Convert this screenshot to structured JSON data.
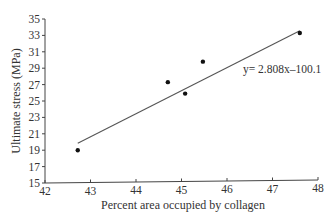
{
  "chart_data": {
    "type": "scatter",
    "title": "",
    "xlabel": "Percent area occupied by collagen",
    "ylabel": "Ultimate stress (MPa)",
    "xlim": [
      42,
      48
    ],
    "ylim": [
      15,
      35
    ],
    "x_ticks": [
      42,
      43,
      44,
      45,
      46,
      47,
      48
    ],
    "y_ticks": [
      15,
      17,
      19,
      21,
      23,
      25,
      27,
      29,
      31,
      33,
      35
    ],
    "grid": false,
    "legend": null,
    "series": [
      {
        "name": "data",
        "points": [
          {
            "x": 42.72,
            "y": 19.0
          },
          {
            "x": 44.7,
            "y": 27.3
          },
          {
            "x": 45.08,
            "y": 25.9
          },
          {
            "x": 45.47,
            "y": 29.8
          },
          {
            "x": 47.6,
            "y": 33.3
          }
        ]
      }
    ],
    "trendline": {
      "slope": 2.808,
      "intercept": -100.1,
      "x_start": 42.72,
      "x_end": 47.6,
      "label": "y= 2.808x–100.1"
    },
    "annotations": [
      "y= 2.808x–100.1"
    ]
  }
}
